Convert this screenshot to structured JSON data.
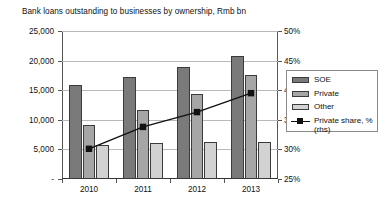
{
  "chart_data": {
    "type": "bar",
    "title": "Bank loans outstanding to businesses by ownership, Rmb bn",
    "xlabel": "",
    "ylabel": "",
    "categories": [
      "2010",
      "2011",
      "2012",
      "2013"
    ],
    "series": [
      {
        "name": "SOE",
        "type": "bar",
        "axis": "left",
        "values": [
          15900,
          17200,
          18900,
          20700
        ]
      },
      {
        "name": "Private",
        "type": "bar",
        "axis": "left",
        "values": [
          9200,
          11600,
          14300,
          17500
        ]
      },
      {
        "name": "Other",
        "type": "bar",
        "axis": "left",
        "values": [
          5700,
          6100,
          6300,
          6200
        ]
      },
      {
        "name": "Private share, % (rhs)",
        "type": "line",
        "axis": "right",
        "values": [
          30.1,
          33.8,
          36.3,
          39.5
        ]
      }
    ],
    "ylim": [
      0,
      25000
    ],
    "y2lim": [
      25,
      50
    ],
    "yticks": [
      "-",
      "5,000",
      "10,000",
      "15,000",
      "20,000",
      "25,000"
    ],
    "ytick_values": [
      0,
      5000,
      10000,
      15000,
      20000,
      25000
    ],
    "y2ticks": [
      "25%",
      "30%",
      "35%",
      "40%",
      "45%",
      "50%"
    ],
    "y2tick_values": [
      25,
      30,
      35,
      40,
      45,
      50
    ],
    "grid": true,
    "legend_position": "right",
    "colors": {
      "soe": "#7a7a7a",
      "private": "#a6a6a6",
      "other": "#d2d2d2",
      "line": "#111111",
      "grid": "#b9b9b9",
      "axis": "#555555"
    }
  },
  "legend": {
    "items": [
      {
        "label": "SOE",
        "icon": "bar-swatch-dark"
      },
      {
        "label": "Private",
        "icon": "bar-swatch-medium"
      },
      {
        "label": "Other",
        "icon": "bar-swatch-light"
      },
      {
        "label": "Private share, % (rhs)",
        "icon": "line-marker-swatch"
      }
    ]
  }
}
